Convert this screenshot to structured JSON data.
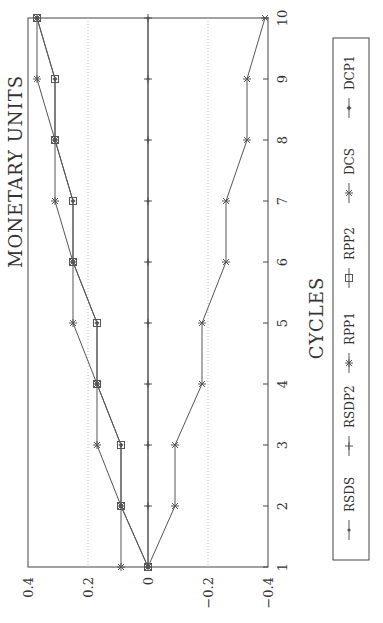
{
  "chart_data": {
    "type": "line",
    "orientation": "rotated-90-ccw",
    "title": "",
    "xlabel": "CYCLES",
    "ylabel": "MONETARY UNITS",
    "x": [
      1,
      2,
      3,
      4,
      5,
      6,
      7,
      8,
      9,
      10
    ],
    "xticks": [
      "1",
      "2",
      "3",
      "4",
      "5",
      "6",
      "7",
      "8",
      "9",
      "10"
    ],
    "yticks": [
      "0.4",
      "0.2",
      "0",
      "−0.2",
      "−0.4"
    ],
    "ylim": [
      -0.4,
      0.4
    ],
    "grid": "dotted at ±0.2, solid at 0",
    "legend_position": "right (below plot when rotated)",
    "series": [
      {
        "name": "RSDS",
        "marker": "dot",
        "values": [
          0,
          0,
          0,
          0,
          0,
          0,
          0,
          0,
          0,
          0
        ]
      },
      {
        "name": "RSDP2",
        "marker": "plus",
        "values": [
          0,
          0,
          0,
          0,
          0,
          0,
          0,
          0,
          0,
          0
        ]
      },
      {
        "name": "RPP1",
        "marker": "asterisk",
        "values": [
          0.09,
          0.09,
          0.17,
          0.17,
          0.25,
          0.25,
          0.31,
          0.31,
          0.37,
          0.37
        ]
      },
      {
        "name": "RPP2",
        "marker": "square",
        "values": [
          0,
          0.09,
          0.09,
          0.17,
          0.17,
          0.25,
          0.25,
          0.31,
          0.31,
          0.37
        ]
      },
      {
        "name": "DCS",
        "marker": "x",
        "values": [
          0,
          -0.09,
          -0.09,
          -0.18,
          -0.18,
          -0.26,
          -0.26,
          -0.33,
          -0.33,
          -0.39
        ]
      },
      {
        "name": "DCP1",
        "marker": "diamond",
        "values": [
          0,
          0.09,
          0.09,
          0.17,
          0.17,
          0.25,
          0.25,
          0.31,
          0.31,
          0.37
        ]
      }
    ]
  },
  "labels": {
    "ylabel": "MONETARY UNITS",
    "xlabel": "CYCLES"
  },
  "legend": [
    {
      "name": "RSDS",
      "marker": "dot"
    },
    {
      "name": "RSDP2",
      "marker": "plus"
    },
    {
      "name": "RPP1",
      "marker": "asterisk"
    },
    {
      "name": "RPP2",
      "marker": "square"
    },
    {
      "name": "DCS",
      "marker": "x"
    },
    {
      "name": "DCP1",
      "marker": "diamond"
    }
  ],
  "colors": {
    "line": "#555555",
    "grid": "#bbbbbb",
    "axis": "#444444"
  }
}
